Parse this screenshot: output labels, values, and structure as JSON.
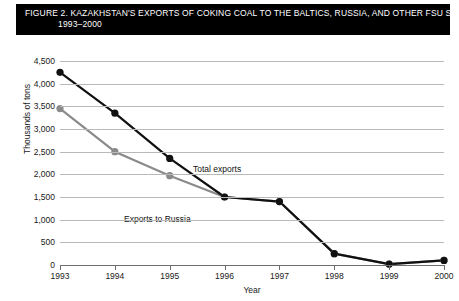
{
  "figure": {
    "title_line1": "FIGURE 2. KAZAKHSTAN'S EXPORTS OF COKING COAL TO THE BALTICS, RUSSIA, AND OTHER FSU STATES,",
    "title_line2": "1993–2000"
  },
  "labels": {
    "total_exports": "Total exports",
    "exports_to_russia": "Exports to Russia"
  },
  "colors": {
    "total_exports": "#111111",
    "exports_to_russia": "#8a8a8a",
    "gridline": "#b9b9b9",
    "axis": "#6e6e6e",
    "title_background": "#000000",
    "title_text": "#ffffff",
    "plot_background": "#ffffff"
  },
  "chart_data": {
    "type": "line",
    "title": "FIGURE 2. KAZAKHSTAN'S EXPORTS OF COKING COAL TO THE BALTICS, RUSSIA, AND OTHER FSU STATES, 1993–2000",
    "xlabel": "Year",
    "ylabel": "Thousands of tons",
    "categories": [
      "1993",
      "1994",
      "1995",
      "1996",
      "1997",
      "1998",
      "1999",
      "2000"
    ],
    "x": [
      1993,
      1994,
      1995,
      1996,
      1997,
      1998,
      1999,
      2000
    ],
    "xlim": [
      1993,
      2000
    ],
    "ylim": [
      0,
      4500
    ],
    "yticks": [
      0,
      500,
      1000,
      1500,
      2000,
      2500,
      3000,
      3500,
      4000,
      4500
    ],
    "ytick_labels": [
      "0",
      "500",
      "1,000",
      "1,500",
      "2,000",
      "2,500",
      "3,000",
      "3,500",
      "4,000",
      "4,500"
    ],
    "grid": true,
    "legend": "inline-annotations",
    "markers": "filled-circle",
    "series": [
      {
        "name": "Total exports",
        "color": "#111111",
        "values": [
          4250,
          3350,
          2350,
          1500,
          1400,
          250,
          20,
          100
        ]
      },
      {
        "name": "Exports to Russia",
        "color": "#8a8a8a",
        "values": [
          3450,
          2500,
          1970,
          1500,
          1400,
          250,
          20,
          100
        ]
      }
    ],
    "annotations": [
      {
        "text": "Total exports",
        "x": 1995.1,
        "y": 2600
      },
      {
        "text": "Exports to Russia",
        "x": 1993.4,
        "y": 1620
      }
    ]
  }
}
